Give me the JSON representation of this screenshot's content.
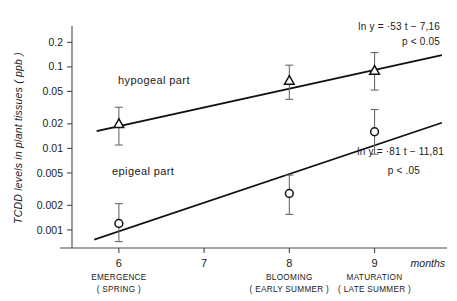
{
  "chart_data": {
    "type": "scatter",
    "title": "",
    "xlabel": "months",
    "ylabel": "TCDD levels in plant tissues ( ppb )",
    "yscale": "log",
    "ylim": [
      0.0006,
      0.3
    ],
    "xlim": [
      5.45,
      9.85
    ],
    "grid": false,
    "legend_position": "inline-annotation",
    "x": [
      6,
      8,
      9
    ],
    "xtick_labels": [
      "6",
      "7",
      "8",
      "9"
    ],
    "xticks": [
      6,
      7,
      8,
      9
    ],
    "ytick_labels": [
      "0.2",
      "0.1",
      "0.05",
      "0.02",
      "0.01",
      "0.005",
      "0.002",
      "0.001"
    ],
    "yticks": [
      0.2,
      0.1,
      0.05,
      0.02,
      0.01,
      0.005,
      0.002,
      0.001
    ],
    "series": [
      {
        "name": "hypogeal part",
        "marker": "triangle",
        "values": [
          0.02,
          0.068,
          0.09
        ],
        "err_low": [
          0.011,
          0.04,
          0.052
        ],
        "err_high": [
          0.032,
          0.105,
          0.15
        ],
        "fit_label": "ln y  = ·53 t − 7,16",
        "fit_p": "p < 0.05",
        "fit_slope": 0.53,
        "fit_intercept": -7.16
      },
      {
        "name": "epigeal part",
        "marker": "circle",
        "values": [
          0.0012,
          0.0028,
          0.016
        ],
        "err_low": [
          0.00072,
          0.00155,
          0.0085
        ],
        "err_high": [
          0.0021,
          0.0047,
          0.03
        ],
        "fit_label": "ln y  = ·81 t − 11,81",
        "fit_p": "p < .05",
        "fit_slope": 0.81,
        "fit_intercept": -11.81
      }
    ],
    "stage_annotations": [
      {
        "month": 6,
        "line1": "EMERGENCE",
        "line2": "( SPRING )"
      },
      {
        "month": 8,
        "line1": "BLOOMING",
        "line2": "( EARLY SUMMER )"
      },
      {
        "month": 9,
        "line1": "MATURATION",
        "line2": "( LATE SUMMER )"
      }
    ],
    "colors": {
      "axis": "#4a4a4a",
      "line": "#111111",
      "errorbar": "#6a6a6a",
      "background": "#ffffff"
    }
  }
}
